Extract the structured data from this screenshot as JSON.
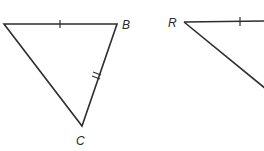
{
  "diagram": {
    "stroke_color": "#2e2e2e",
    "triangle_abc": {
      "vertices": {
        "A": {
          "x": 4,
          "y": 24,
          "label": ""
        },
        "B": {
          "x": 117,
          "y": 24,
          "label": "B"
        },
        "C": {
          "x": 82,
          "y": 126,
          "label": "C"
        }
      },
      "tick_marks": [
        {
          "side": "AB",
          "count": 1
        },
        {
          "side": "BC",
          "count": 2
        }
      ]
    },
    "triangle_r": {
      "vertices": {
        "R": {
          "x": 184,
          "y": 22,
          "label": "R"
        }
      },
      "tick_marks": [
        {
          "side": "R-top",
          "count": 1
        }
      ],
      "partially_visible": true
    }
  }
}
